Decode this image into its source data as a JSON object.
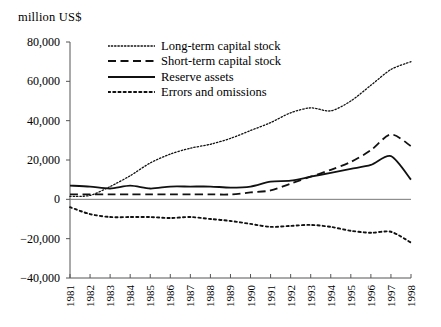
{
  "chart_data": {
    "type": "line",
    "title": "",
    "ylabel": "million US$",
    "xlabel": "",
    "ylim": [
      -40000,
      80000
    ],
    "yticks": [
      80000,
      60000,
      40000,
      20000,
      0,
      -20000,
      -40000
    ],
    "ytick_labels": [
      "80,000",
      "60,000",
      "40,000",
      "20,000",
      "0",
      "−20,000",
      "−40,000"
    ],
    "grid": false,
    "legend_position": "upper-left-inside",
    "x": [
      1981,
      1982,
      1983,
      1984,
      1985,
      1986,
      1987,
      1988,
      1989,
      1990,
      1991,
      1992,
      1993,
      1994,
      1995,
      1996,
      1997,
      1998
    ],
    "xtick_labels": [
      "1981",
      "1982",
      "1983",
      "1984",
      "1985",
      "1986",
      "1987",
      "1988",
      "1989",
      "1990",
      "1991",
      "1992",
      "1993",
      "1994",
      "1995",
      "1996",
      "1997",
      "1998"
    ],
    "series": [
      {
        "name": "Long-term capital stock",
        "style": "dotted-fine",
        "values": [
          1500,
          2000,
          6500,
          12000,
          18500,
          23000,
          26000,
          28000,
          31000,
          35000,
          39000,
          44000,
          46500,
          45000,
          50000,
          58000,
          66000,
          70000
        ]
      },
      {
        "name": "Short-term capital stock",
        "style": "dashed",
        "values": [
          2500,
          2500,
          2500,
          2500,
          2500,
          2500,
          2500,
          2500,
          2500,
          3500,
          4500,
          8000,
          11500,
          15000,
          19000,
          25000,
          33000,
          27000
        ]
      },
      {
        "name": "Reserve assets",
        "style": "solid",
        "values": [
          7000,
          6500,
          5500,
          7000,
          5500,
          6500,
          6500,
          6500,
          6000,
          6500,
          9000,
          9500,
          11500,
          13500,
          15500,
          17500,
          22000,
          10000
        ]
      },
      {
        "name": "Errors and omissions",
        "style": "dotted-coarse",
        "values": [
          -4000,
          -7500,
          -9000,
          -9000,
          -9000,
          -9500,
          -9000,
          -10000,
          -11000,
          -12500,
          -14000,
          -13500,
          -13000,
          -14000,
          -16000,
          -17000,
          -16500,
          -22000
        ]
      }
    ]
  },
  "legend": {
    "items": [
      {
        "label": "Long-term capital stock"
      },
      {
        "label": "Short-term capital stock"
      },
      {
        "label": "Reserve assets"
      },
      {
        "label": "Errors and omissions"
      }
    ]
  }
}
